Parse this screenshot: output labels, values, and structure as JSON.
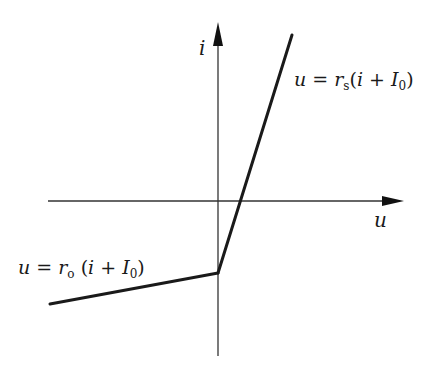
{
  "diagram": {
    "type": "piecewise-linear characteristic",
    "axes": {
      "horizontal": {
        "label": "u"
      },
      "vertical": {
        "label": "i"
      }
    },
    "segments": [
      {
        "name": "upper-segment",
        "equation": "u = r_s(i + I_0)",
        "parts": {
          "lhs": "u",
          "eq": "=",
          "r": "r",
          "r_sub": "s",
          "open": "(",
          "i": "i",
          "plus": "+",
          "I": "I",
          "I_sub": "0",
          "close": ")"
        }
      },
      {
        "name": "lower-segment",
        "equation": "u = r_o(i + I_0)",
        "parts": {
          "lhs": "u",
          "eq": "=",
          "r": "r",
          "r_sub": "o",
          "open": "(",
          "i": "i",
          "plus": "+",
          "I": "I",
          "I_sub": "0",
          "close": ")"
        }
      }
    ],
    "colors": {
      "line": "#1a1a1a",
      "axis": "#333333",
      "background": "#ffffff"
    }
  }
}
